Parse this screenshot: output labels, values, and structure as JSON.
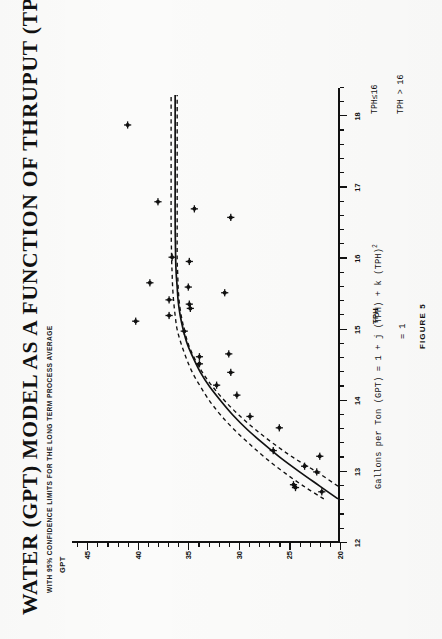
{
  "figure": {
    "title": "WATER (GPT) MODEL AS A FUNCTION OF THRUPUT (TPH)",
    "subtitle": "WITH 95% CONFIDENCE LIMITS FOR THE LONG TERM PROCESS AVERAGE",
    "caption": "FIGURE 5",
    "equation_line1": "Gallons per Ton (GPT) = 1 + j (TPH) + k (TPH)",
    "equation_exponent": "2",
    "equation_line2": "= 1",
    "condition1": "TPH≤16",
    "condition2": "TPH > 16",
    "ink_color": "#111111",
    "paper_color": "#fbfbfa"
  },
  "chart_data": {
    "type": "scatter",
    "title": "WATER (GPT) MODEL AS A FUNCTION OF THRUPUT (TPH)",
    "subtitle": "WITH 95% CONFIDENCE LIMITS FOR THE LONG TERM PROCESS AVERAGE",
    "xlabel": "TPH",
    "ylabel": "GPT",
    "xlim": [
      12,
      18.4
    ],
    "ylim": [
      20,
      46.5
    ],
    "xticks": [
      12,
      13,
      14,
      15,
      16,
      17,
      18
    ],
    "xticklabels": [
      "12",
      "13",
      "14",
      "15",
      "16",
      "17",
      "18"
    ],
    "yticks": [
      20,
      25,
      30,
      35,
      40,
      45
    ],
    "yticklabels": [
      "20",
      "25",
      "30",
      "35",
      "40",
      "45"
    ],
    "x_minor_step": 0.2,
    "y_minor_step": 1,
    "grid": false,
    "legend": null,
    "series": [
      {
        "name": "Observations",
        "marker": "plus-dot",
        "points": [
          [
            12.72,
            21.8
          ],
          [
            12.78,
            24.4
          ],
          [
            12.82,
            24.6
          ],
          [
            13.0,
            22.3
          ],
          [
            13.08,
            23.5
          ],
          [
            13.22,
            22.0
          ],
          [
            13.3,
            26.6
          ],
          [
            13.62,
            26.0
          ],
          [
            13.78,
            28.9
          ],
          [
            14.08,
            30.2
          ],
          [
            14.22,
            32.2
          ],
          [
            14.4,
            30.8
          ],
          [
            14.52,
            33.9
          ],
          [
            14.62,
            33.9
          ],
          [
            14.66,
            31.0
          ],
          [
            14.98,
            35.4
          ],
          [
            15.12,
            40.2
          ],
          [
            15.2,
            36.9
          ],
          [
            15.3,
            34.8
          ],
          [
            15.36,
            34.9
          ],
          [
            15.42,
            36.9
          ],
          [
            15.52,
            31.4
          ],
          [
            15.6,
            35.0
          ],
          [
            15.66,
            38.8
          ],
          [
            15.96,
            34.9
          ],
          [
            16.02,
            36.6
          ],
          [
            16.58,
            30.8
          ],
          [
            16.7,
            34.4
          ],
          [
            16.8,
            38.0
          ],
          [
            17.88,
            41.0
          ]
        ]
      }
    ],
    "fit_curve": {
      "name": "Model (GPT = 1 + j TPH + k TPH^2)",
      "style": "solid",
      "points": [
        [
          12.62,
          20.2
        ],
        [
          12.8,
          22.0
        ],
        [
          13.0,
          24.0
        ],
        [
          13.2,
          25.9
        ],
        [
          13.4,
          27.6
        ],
        [
          13.6,
          29.2
        ],
        [
          13.8,
          30.6
        ],
        [
          14.0,
          31.8
        ],
        [
          14.2,
          32.9
        ],
        [
          14.4,
          33.8
        ],
        [
          14.6,
          34.5
        ],
        [
          14.8,
          35.1
        ],
        [
          15.0,
          35.5
        ],
        [
          15.2,
          35.8
        ],
        [
          15.4,
          36.0
        ],
        [
          15.6,
          36.1
        ],
        [
          15.8,
          36.2
        ],
        [
          16.0,
          36.25
        ],
        [
          16.5,
          36.3
        ],
        [
          17.0,
          36.3
        ],
        [
          17.5,
          36.3
        ],
        [
          18.0,
          36.3
        ],
        [
          18.3,
          36.3
        ]
      ]
    },
    "confidence_bands": {
      "name": "95% confidence limits for long term process average",
      "style": "dashed",
      "upper": [
        [
          12.8,
          20.2
        ],
        [
          13.0,
          22.3
        ],
        [
          13.2,
          24.6
        ],
        [
          13.4,
          26.6
        ],
        [
          13.6,
          28.4
        ],
        [
          13.8,
          30.0
        ],
        [
          14.0,
          31.4
        ],
        [
          14.2,
          32.6
        ],
        [
          14.4,
          33.6
        ],
        [
          14.6,
          34.4
        ],
        [
          14.8,
          35.0
        ],
        [
          15.0,
          35.4
        ],
        [
          15.2,
          35.7
        ],
        [
          15.4,
          35.9
        ],
        [
          15.6,
          36.0
        ],
        [
          15.8,
          36.05
        ],
        [
          16.0,
          36.1
        ],
        [
          16.5,
          36.1
        ],
        [
          17.0,
          36.1
        ],
        [
          17.5,
          36.1
        ],
        [
          18.0,
          36.1
        ],
        [
          18.3,
          36.1
        ]
      ],
      "lower": [
        [
          12.62,
          21.6
        ],
        [
          12.8,
          23.6
        ],
        [
          13.0,
          25.6
        ],
        [
          13.2,
          27.4
        ],
        [
          13.4,
          29.0
        ],
        [
          13.6,
          30.5
        ],
        [
          13.8,
          31.8
        ],
        [
          14.0,
          32.9
        ],
        [
          14.2,
          33.8
        ],
        [
          14.4,
          34.6
        ],
        [
          14.6,
          35.2
        ],
        [
          14.8,
          35.7
        ],
        [
          15.0,
          36.1
        ],
        [
          15.2,
          36.3
        ],
        [
          15.4,
          36.45
        ],
        [
          15.6,
          36.55
        ],
        [
          15.8,
          36.6
        ],
        [
          16.0,
          36.65
        ],
        [
          16.5,
          36.7
        ],
        [
          17.0,
          36.7
        ],
        [
          17.5,
          36.7
        ],
        [
          18.0,
          36.7
        ],
        [
          18.3,
          36.7
        ]
      ]
    }
  }
}
